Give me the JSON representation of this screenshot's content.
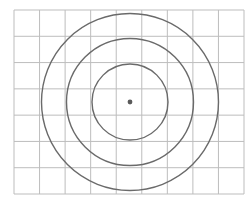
{
  "figure": {
    "grid": {
      "columns": 9,
      "rows": 7,
      "left": 14,
      "top": 10,
      "right": 244,
      "bottom": 194,
      "line_color": "#bdbdbd"
    },
    "center": {
      "x": 130,
      "y": 102,
      "color": "#5a5a5a",
      "radius": 2.4
    },
    "circles": [
      {
        "r": 38,
        "color": "#6a6a6a"
      },
      {
        "r": 63.5,
        "color": "#6a6a6a"
      },
      {
        "r": 88.5,
        "color": "#6a6a6a"
      }
    ]
  }
}
